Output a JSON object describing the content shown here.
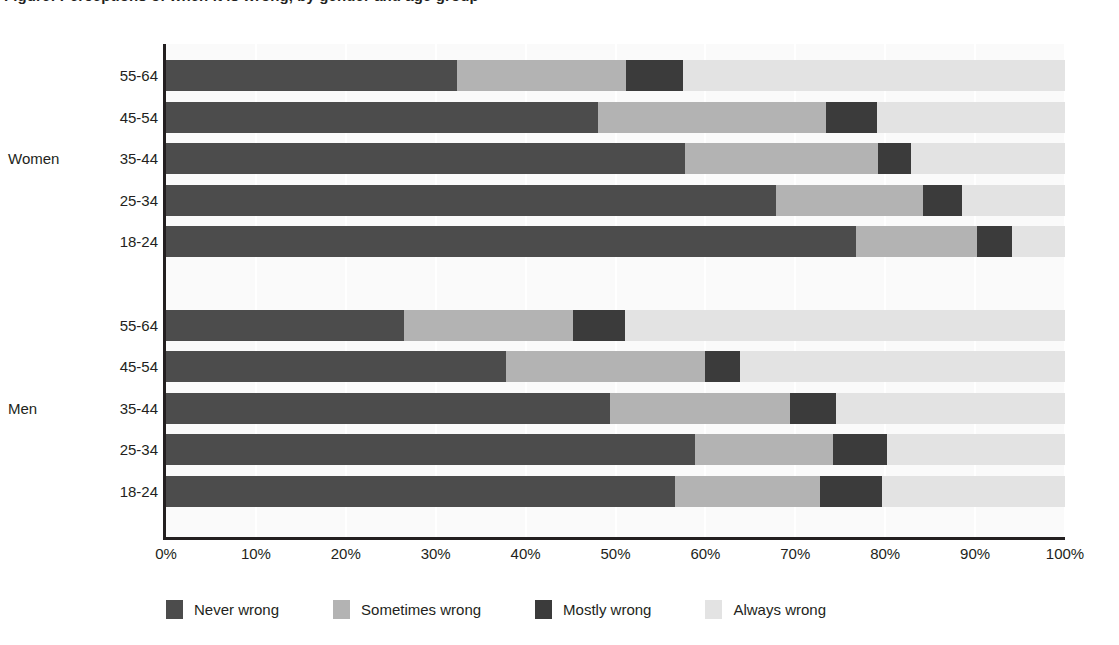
{
  "chart_data": {
    "type": "bar",
    "orientation": "horizontal",
    "stacked": true,
    "stacked_mode": "percent",
    "title": "Figure: Perceptions of when it is wrong, by gender and age group",
    "xlabel": "",
    "ylabel": "",
    "xlim": [
      0,
      100
    ],
    "xticks": [
      "0%",
      "10%",
      "20%",
      "30%",
      "40%",
      "50%",
      "60%",
      "70%",
      "80%",
      "90%",
      "100%"
    ],
    "xtick_values": [
      0,
      10,
      20,
      30,
      40,
      50,
      60,
      70,
      80,
      90,
      100
    ],
    "grid": true,
    "legend_position": "bottom",
    "legend": [
      "Never wrong",
      "Sometimes wrong",
      "Mostly wrong",
      "Always wrong"
    ],
    "series_colors": [
      "#4c4c4c",
      "#b3b3b3",
      "#3b3b3b",
      "#e3e3e3"
    ],
    "groups": [
      {
        "name": "Women",
        "categories": [
          "55-64",
          "45-54",
          "35-44",
          "25-34",
          "18-24"
        ],
        "rows": [
          {
            "category": "55-64",
            "values": [
              32.4,
              18.8,
              6.3,
              42.5
            ]
          },
          {
            "category": "45-54",
            "values": [
              48.0,
              25.4,
              5.7,
              20.9
            ]
          },
          {
            "category": "35-44",
            "values": [
              57.7,
              21.5,
              3.7,
              17.1
            ]
          },
          {
            "category": "25-34",
            "values": [
              67.9,
              16.3,
              4.3,
              11.5
            ]
          },
          {
            "category": "18-24",
            "values": [
              76.8,
              13.4,
              3.9,
              5.9
            ]
          }
        ]
      },
      {
        "name": "Men",
        "categories": [
          "55-64",
          "45-54",
          "35-44",
          "25-34",
          "18-24"
        ],
        "rows": [
          {
            "category": "55-64",
            "values": [
              26.5,
              18.8,
              5.8,
              48.9
            ]
          },
          {
            "category": "45-54",
            "values": [
              37.8,
              22.2,
              3.9,
              36.1
            ]
          },
          {
            "category": "35-44",
            "values": [
              49.4,
              20.0,
              5.1,
              25.5
            ]
          },
          {
            "category": "25-34",
            "values": [
              58.8,
              15.4,
              6.0,
              19.8
            ]
          },
          {
            "category": "18-24",
            "values": [
              56.6,
              16.1,
              6.9,
              20.4
            ]
          }
        ]
      }
    ]
  },
  "axis": {
    "tick_labels": [
      "0%",
      "10%",
      "20%",
      "30%",
      "40%",
      "50%",
      "60%",
      "70%",
      "80%",
      "90%",
      "100%"
    ]
  },
  "legend": {
    "items": [
      {
        "label": "Never wrong",
        "key": "never"
      },
      {
        "label": "Sometimes wrong",
        "key": "sometimes"
      },
      {
        "label": "Mostly wrong",
        "key": "mostly"
      },
      {
        "label": "Always wrong",
        "key": "always"
      }
    ]
  },
  "colors": {
    "never": "#4c4c4c",
    "sometimes": "#b3b3b3",
    "mostly": "#3b3b3b",
    "always": "#e3e3e3",
    "axis": "#231f20",
    "plot_background": "#fafafa",
    "page_background": "#ffffff"
  }
}
